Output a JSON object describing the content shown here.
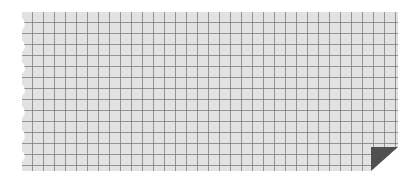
{
  "graphic": {
    "type": "graph-paper-note",
    "colors": {
      "paper": "#e2e2e2",
      "grid_line": "#787878",
      "fold": "#505050",
      "background": "#ffffff"
    },
    "grid_cell_px": 11,
    "torn_edge": "left",
    "folded_corner": "bottom-right"
  }
}
